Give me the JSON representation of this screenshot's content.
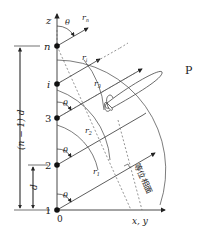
{
  "diagram": {
    "axes": {
      "z_label": "z",
      "x_label": "x, y",
      "origin_label": "0"
    },
    "elements": [
      {
        "label": "1",
        "y": 210
      },
      {
        "label": "2",
        "y": 165
      },
      {
        "label": "3",
        "y": 118
      },
      {
        "label": "i",
        "y": 84
      },
      {
        "label": "n",
        "y": 46
      }
    ],
    "angle_label": "θ",
    "ray_labels": {
      "r1": "r",
      "r1_sub": "1",
      "r2": "r",
      "r2_sub": "2",
      "r3": "r",
      "r3_sub": "3",
      "ri": "r",
      "ri_sub": "i",
      "rn": "r",
      "rn_sub": "n"
    },
    "dimensions": {
      "spacing": "d",
      "total": "(n − 1) d"
    },
    "far_point_label": "P",
    "wavefront_label": "等位相面",
    "colors": {
      "line": "#333333",
      "dashed": "#666666",
      "dot": "#111111"
    }
  }
}
